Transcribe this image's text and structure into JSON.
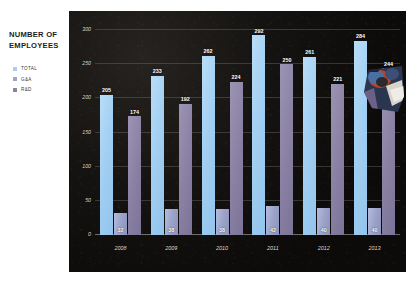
{
  "slide": {
    "background_color": "#ffffff",
    "panel_color": "#100e0c"
  },
  "title": {
    "text": "NUMBER OF EMPLOYEES"
  },
  "legend": {
    "position": "left-panel",
    "items": [
      {
        "label": "TOTAL",
        "color": "#a2cff2"
      },
      {
        "label": "G&A",
        "color": "#9ba3c9"
      },
      {
        "label": "R&D",
        "color": "#8a81a4"
      }
    ]
  },
  "overlay": {
    "name": "photo-fragment",
    "description": "person in helmet overlay image"
  },
  "chart_data": {
    "type": "bar",
    "title": "NUMBER OF EMPLOYEES",
    "xlabel": "",
    "ylabel": "",
    "categories": [
      "2008",
      "2009",
      "2010",
      "2011",
      "2012",
      "2013"
    ],
    "series": [
      {
        "name": "TOTAL",
        "color": "#a2cff2",
        "values": [
          205,
          233,
          262,
          292,
          261,
          284
        ]
      },
      {
        "name": "G&A",
        "color": "#9ba3c9",
        "values": [
          32,
          38,
          38,
          42,
          40,
          40
        ]
      },
      {
        "name": "R&D",
        "color": "#8a81a4",
        "values": [
          174,
          192,
          224,
          250,
          221,
          244
        ]
      }
    ],
    "ylim": [
      0,
      300
    ],
    "yticks": [
      0,
      50,
      100,
      150,
      200,
      250,
      300
    ],
    "ytick_labels": [
      "0",
      "50",
      "100",
      "150",
      "200",
      "250",
      "300"
    ],
    "grid": true,
    "legend_position": "left",
    "data_labels": true
  }
}
